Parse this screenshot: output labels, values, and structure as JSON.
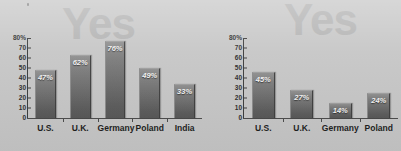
{
  "background_color": "#c6c6c6",
  "accent_color": "#6a6a6a",
  "watermark_color": "#b0b0b0",
  "charts": [
    {
      "name": "left-chart",
      "watermark": "Yes",
      "chart_data": {
        "type": "bar",
        "title": "",
        "xlabel": "",
        "ylabel": "",
        "categories": [
          "U.S.",
          "U.K.",
          "Germany",
          "Poland",
          "India"
        ],
        "values": [
          47,
          62,
          76,
          49,
          33
        ],
        "value_labels": [
          "47%",
          "62%",
          "76%",
          "49%",
          "33%"
        ],
        "ylim": [
          0,
          80
        ],
        "ytick_labels": [
          "80%",
          "70",
          "60",
          "50",
          "40",
          "30",
          "20",
          "10",
          "0"
        ],
        "yticks": [
          80,
          70,
          60,
          50,
          40,
          30,
          20,
          10,
          0
        ],
        "grid": false,
        "legend": null
      }
    },
    {
      "name": "right-chart",
      "watermark": "Yes",
      "chart_data": {
        "type": "bar",
        "title": "",
        "xlabel": "",
        "ylabel": "",
        "categories": [
          "U.S.",
          "U.K.",
          "Germany",
          "Poland"
        ],
        "values": [
          45,
          27,
          14,
          24
        ],
        "value_labels": [
          "45%",
          "27%",
          "14%",
          "24%"
        ],
        "ylim": [
          0,
          80
        ],
        "ytick_labels": [
          "80%",
          "70",
          "60",
          "50",
          "40",
          "30",
          "20",
          "10",
          "0"
        ],
        "yticks": [
          80,
          70,
          60,
          50,
          40,
          30,
          20,
          10,
          0
        ],
        "grid": false,
        "legend": null
      }
    }
  ]
}
